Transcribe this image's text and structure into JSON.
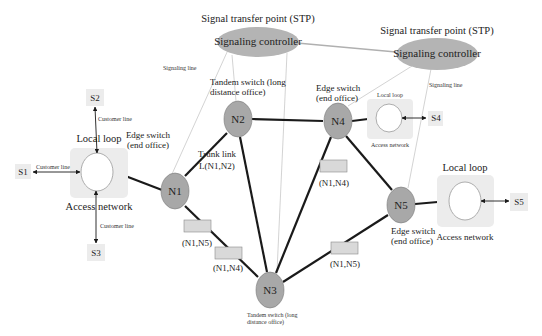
{
  "colors": {
    "node_fill": "#a8a8a8",
    "node_stroke": "#7a7a7a",
    "stp_fill": "#b4b4b4",
    "access_box": "#ececec",
    "subscriber_box": "#ececec",
    "link_box_fill": "#d9d9d9",
    "link_box_stroke": "#8a8a8a",
    "trunk_line": "#1a1a1a",
    "signaling_line": "#c8c8c8"
  },
  "stps": [
    {
      "id": "stp1",
      "title": "Signal transfer point (STP)",
      "label": "Signaling controller"
    },
    {
      "id": "stp2",
      "title": "Signal transfer point (STP)",
      "label": "Signaling controller"
    }
  ],
  "nodes": [
    {
      "id": "N1",
      "label": "N1",
      "caption": [
        "Edge switch",
        "(end office)"
      ]
    },
    {
      "id": "N2",
      "label": "N2",
      "caption": [
        "Tandem switch (long",
        "distance office)"
      ]
    },
    {
      "id": "N3",
      "label": "N3",
      "caption": [
        "Tandem switch (long",
        "distance office)"
      ]
    },
    {
      "id": "N4",
      "label": "N4",
      "caption": [
        "Edge switch",
        "(end office)"
      ]
    },
    {
      "id": "N5",
      "label": "N5",
      "caption": [
        "Edge switch",
        "(end office)"
      ]
    }
  ],
  "trunk_link": {
    "title": "Trunk link",
    "label": "L(N1,N2)"
  },
  "link_boxes": [
    {
      "label": "(N1,N4)"
    },
    {
      "label": "(N1,N5)"
    },
    {
      "label": "(N1,N4)"
    },
    {
      "label": "(N1,N5)"
    }
  ],
  "access_networks": [
    {
      "top_label": "Local loop",
      "bottom_label": "Access network"
    },
    {
      "top_label": "Local loop",
      "bottom_label": "Access network"
    },
    {
      "top_label": "Local loop",
      "bottom_label": "Access network"
    }
  ],
  "subscribers": [
    "S1",
    "S2",
    "S3",
    "S4",
    "S5"
  ],
  "line_labels": {
    "customer_line": "Customer line",
    "signaling_line": "Signaling line"
  }
}
